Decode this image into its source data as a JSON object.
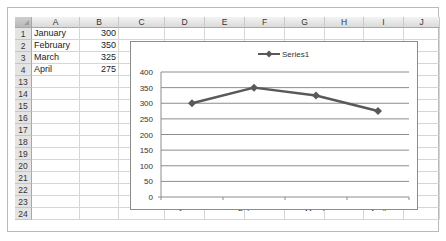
{
  "spreadsheet": {
    "columns": [
      "A",
      "B",
      "C",
      "D",
      "E",
      "F",
      "G",
      "H",
      "I",
      "J"
    ],
    "rows": [
      {
        "num": "1",
        "a": "January",
        "b": "300"
      },
      {
        "num": "2",
        "a": "February",
        "b": "350"
      },
      {
        "num": "3",
        "a": "March",
        "b": "325"
      },
      {
        "num": "4",
        "a": "April",
        "b": "275"
      },
      {
        "num": "13",
        "a": "",
        "b": ""
      },
      {
        "num": "14",
        "a": "",
        "b": ""
      },
      {
        "num": "15",
        "a": "",
        "b": ""
      },
      {
        "num": "16",
        "a": "",
        "b": ""
      },
      {
        "num": "17",
        "a": "",
        "b": ""
      },
      {
        "num": "18",
        "a": "",
        "b": ""
      },
      {
        "num": "19",
        "a": "",
        "b": ""
      },
      {
        "num": "20",
        "a": "",
        "b": ""
      },
      {
        "num": "21",
        "a": "",
        "b": ""
      },
      {
        "num": "22",
        "a": "",
        "b": ""
      },
      {
        "num": "23",
        "a": "",
        "b": ""
      },
      {
        "num": "24",
        "a": "",
        "b": ""
      }
    ]
  },
  "chart_data": {
    "type": "line",
    "categories": [
      "January",
      "February",
      "March",
      "April"
    ],
    "series": [
      {
        "name": "Series1",
        "values": [
          300,
          350,
          325,
          275
        ],
        "color": "#595959",
        "marker": "diamond"
      }
    ],
    "title": "",
    "xlabel": "",
    "ylabel": "",
    "ylim": [
      0,
      400
    ],
    "yticks": [
      "0",
      "50",
      "100",
      "150",
      "200",
      "250",
      "300",
      "350",
      "400"
    ],
    "grid": true,
    "legend_position": "top"
  },
  "colors": {
    "line": "#595959",
    "grid": "#8c8c8c",
    "header_bg": "#e4e4e4"
  }
}
